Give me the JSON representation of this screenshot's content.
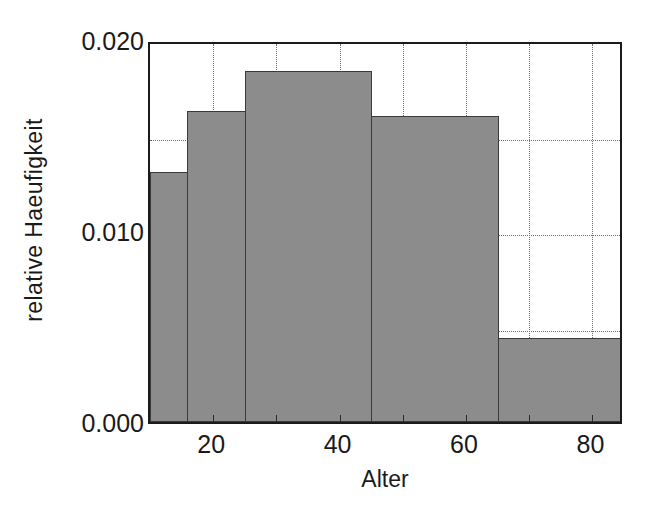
{
  "chart_data": {
    "type": "bar",
    "title": "",
    "subtitle": "",
    "xlabel": "Alter",
    "ylabel": "relative Haeufigkeit",
    "xlim": [
      10,
      85
    ],
    "ylim": [
      0.0,
      0.02
    ],
    "grid": true,
    "legend": null,
    "bar_style": "histogram-contiguous",
    "bar_fill_color": "#8c8c8c",
    "bar_edge_color": "#3a3a3a",
    "axis_color": "#1b1b1b",
    "grid_color": "#6e6e6e",
    "background_color": "#ffffff",
    "x_tick_labels": [
      "20",
      "40",
      "60",
      "80"
    ],
    "x_tick_values": [
      20,
      40,
      60,
      80
    ],
    "y_tick_labels": [
      "0.000",
      "0.010",
      "0.020"
    ],
    "y_tick_values": [
      0.0,
      0.01,
      0.02
    ],
    "x_gridline_values": [
      20,
      30,
      40,
      50,
      60,
      70,
      80
    ],
    "y_gridline_values": [
      0.005,
      0.01,
      0.015
    ],
    "categories": [
      "10-15",
      "15-25",
      "25-45",
      "45-65",
      "65-85"
    ],
    "bin_edges": [
      10,
      15.8,
      25,
      45,
      65,
      85
    ],
    "values": [
      0.0131,
      0.0163,
      0.0184,
      0.016,
      0.0044
    ],
    "bars": [
      {
        "label": "10-15",
        "x0": 10,
        "x1": 15.8,
        "value": 0.0131
      },
      {
        "label": "15-25",
        "x0": 15.8,
        "x1": 25,
        "value": 0.0163
      },
      {
        "label": "25-45",
        "x0": 25,
        "x1": 45,
        "value": 0.0184
      },
      {
        "label": "45-65",
        "x0": 45,
        "x1": 65,
        "value": 0.016
      },
      {
        "label": "65-85",
        "x0": 65,
        "x1": 85,
        "value": 0.0044
      }
    ]
  }
}
